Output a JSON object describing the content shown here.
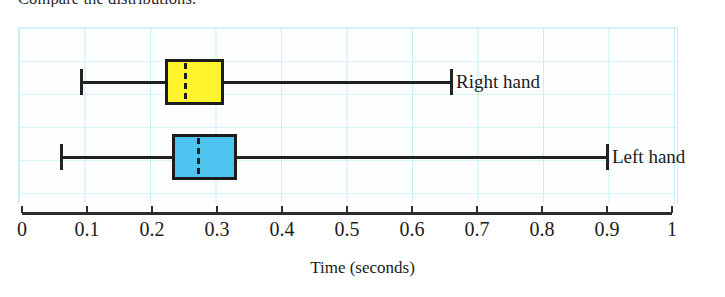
{
  "prompt": {
    "text": "Compare the distributions."
  },
  "chart_data": {
    "type": "boxplot",
    "title": "",
    "xlabel": "Time (seconds)",
    "ylabel": "",
    "xlim": [
      0,
      1
    ],
    "xticks": [
      "0",
      "0.1",
      "0.2",
      "0.3",
      "0.4",
      "0.5",
      "0.6",
      "0.7",
      "0.8",
      "0.9",
      "1"
    ],
    "xtick_values": [
      0,
      0.1,
      0.2,
      0.3,
      0.4,
      0.5,
      0.6,
      0.7,
      0.8,
      0.9,
      1
    ],
    "grid": true,
    "grid_color": "#c6eff6",
    "orientation": "horizontal",
    "legend_position": "right-inline",
    "series": [
      {
        "name": "Right hand",
        "label": "Right hand",
        "color": "#FFF42B",
        "edge_color": "#1c1c1c",
        "min": 0.09,
        "q1": 0.22,
        "median": 0.25,
        "q3": 0.31,
        "max": 0.66
      },
      {
        "name": "Left hand",
        "label": "Left hand",
        "color": "#4FC3F0",
        "edge_color": "#1c1c1c",
        "min": 0.06,
        "q1": 0.23,
        "median": 0.27,
        "q3": 0.33,
        "max": 0.9
      }
    ]
  },
  "geometry": {
    "axis_left_px": 22,
    "axis_right_px": 672,
    "row_centers_px": [
      82,
      157
    ],
    "box_height_px": 46,
    "whisker_cap_height_px": 26
  }
}
